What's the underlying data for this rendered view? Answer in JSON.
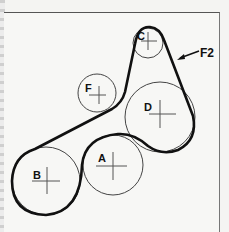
{
  "diagram": {
    "belt": {
      "label": "F2",
      "color": "#111111"
    },
    "pulleys": [
      {
        "id": "A",
        "label": "A",
        "cx": 113,
        "cy": 165,
        "r": 30
      },
      {
        "id": "B",
        "label": "B",
        "cx": 46,
        "cy": 181,
        "r": 34
      },
      {
        "id": "C",
        "label": "C",
        "cx": 148,
        "cy": 43,
        "r": 15
      },
      {
        "id": "D",
        "label": "D",
        "cx": 160,
        "cy": 117,
        "r": 35
      },
      {
        "id": "F",
        "label": "F",
        "cx": 97,
        "cy": 93,
        "r": 19
      }
    ]
  }
}
